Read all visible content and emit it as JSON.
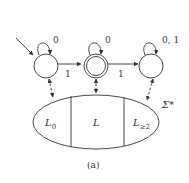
{
  "diagram": {
    "caption": "(a)",
    "states": [
      {
        "id": "q0",
        "initial": true,
        "accepting": false,
        "self_loop_label": "0"
      },
      {
        "id": "q1",
        "initial": false,
        "accepting": true,
        "self_loop_label": "0"
      },
      {
        "id": "q2",
        "initial": false,
        "accepting": false,
        "self_loop_label": "0, 1"
      }
    ],
    "transitions": [
      {
        "from": "q0",
        "to": "q1",
        "label": "1"
      },
      {
        "from": "q1",
        "to": "q2",
        "label": "1"
      }
    ],
    "universe_label": "Σ*",
    "partitions": [
      {
        "label": "L",
        "subscript": "0"
      },
      {
        "label": "L",
        "subscript": ""
      },
      {
        "label": "L",
        "subscript": "≥2"
      }
    ]
  }
}
